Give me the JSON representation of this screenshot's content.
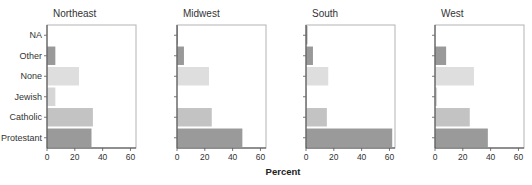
{
  "chart_data": {
    "type": "bar",
    "orientation": "horizontal",
    "xlabel": "Percent",
    "ylabel": "",
    "xlim": [
      0,
      64
    ],
    "xticks": [
      0,
      20,
      40,
      60
    ],
    "grid": false,
    "legend": "none",
    "categories": [
      "NA",
      "Other",
      "None",
      "Jewish",
      "Catholic",
      "Protestant"
    ],
    "category_colors": {
      "NA": "#8c8c8c",
      "Other": "#999999",
      "None": "#dedede",
      "Jewish": "#d6d6d6",
      "Catholic": "#c3c3c3",
      "Protestant": "#9a9a9a"
    },
    "panels": [
      {
        "title": "Northeast",
        "values": {
          "NA": 0,
          "Other": 6,
          "None": 23,
          "Jewish": 6,
          "Catholic": 33,
          "Protestant": 32
        }
      },
      {
        "title": "Midwest",
        "values": {
          "NA": 0.5,
          "Other": 5,
          "None": 23,
          "Jewish": 0,
          "Catholic": 25,
          "Protestant": 47
        }
      },
      {
        "title": "South",
        "values": {
          "NA": 1,
          "Other": 5,
          "None": 16,
          "Jewish": 0.5,
          "Catholic": 15,
          "Protestant": 62
        }
      },
      {
        "title": "West",
        "values": {
          "NA": 0,
          "Other": 8,
          "None": 28,
          "Jewish": 1.5,
          "Catholic": 25,
          "Protestant": 38
        }
      }
    ]
  }
}
